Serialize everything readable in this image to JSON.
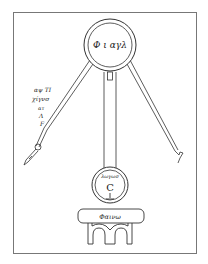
{
  "diagram": {
    "type": "hand-drawn schematic",
    "top_circle": {
      "label": "Φ ι αγλ"
    },
    "lower_circle": {
      "top_label": "λωγωσ",
      "center_letter": "C"
    },
    "base_plate": {
      "label": "Φαινω"
    },
    "side_annotation": {
      "lines": [
        "αψ ΤΙ",
        "χίγνσ",
        "ατ",
        "Λ",
        "F"
      ]
    }
  },
  "colors": {
    "ink": "#333333",
    "frame": "#777777",
    "background": "#ffffff"
  }
}
